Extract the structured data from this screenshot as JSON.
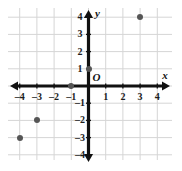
{
  "chart_data": {
    "type": "scatter",
    "title": "",
    "xlabel": "x",
    "ylabel": "y",
    "origin_label": "O",
    "grid": true,
    "legend": "none",
    "xlim": [
      -4.7,
      4.7
    ],
    "ylim": [
      -4.7,
      4.7
    ],
    "xticks": [
      -4,
      -3,
      -2,
      -1,
      1,
      2,
      3,
      4
    ],
    "yticks": [
      4,
      3,
      2,
      1,
      -1,
      -2,
      -3,
      -4
    ],
    "xtick_labels": [
      "–4",
      "–3",
      "–2",
      "–1",
      "1",
      "2",
      "3",
      "4"
    ],
    "ytick_labels": [
      "4",
      "3",
      "2",
      "1",
      "–1",
      "–2",
      "–3",
      "–4"
    ],
    "points": [
      {
        "x": 3,
        "y": 4
      },
      {
        "x": 0,
        "y": 1
      },
      {
        "x": -1,
        "y": 0
      },
      {
        "x": -3,
        "y": -2
      },
      {
        "x": -4,
        "y": -3
      }
    ],
    "point_color": "#555555",
    "axis_color": "#111111",
    "grid_color": "#d5d5d5"
  }
}
